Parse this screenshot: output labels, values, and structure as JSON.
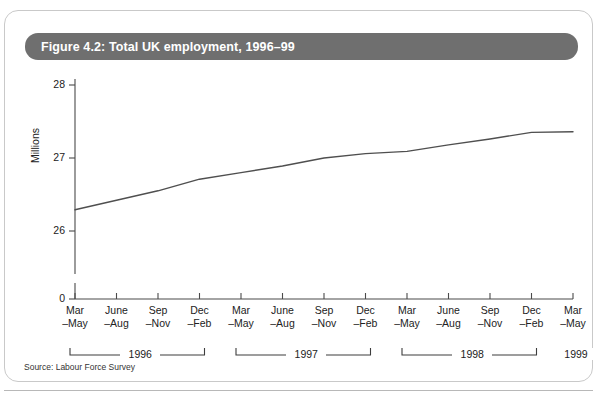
{
  "figure": {
    "title": "Figure 4.2: Total UK employment, 1996–99",
    "source": "Source: Labour Force Survey",
    "banner_color": "#6f6f6f",
    "line_color": "#4f4f4f"
  },
  "chart_data": {
    "type": "line",
    "title": "Figure 4.2: Total UK employment, 1996–99",
    "xlabel": "",
    "ylabel": "Millions",
    "ylim": [
      25.6,
      28.0
    ],
    "yticks": [
      26,
      27,
      28
    ],
    "ytick_labels": [
      "26",
      "27",
      "28"
    ],
    "y_origin_label": "0",
    "y_axis_broken": true,
    "grid": false,
    "legend": null,
    "categories": [
      "Mar\n–May",
      "June\n–Aug",
      "Sep\n–Nov",
      "Dec\n–Feb",
      "Mar\n–May",
      "June\n–Aug",
      "Sep\n–Nov",
      "Dec\n–Feb",
      "Mar\n–May",
      "June\n–Aug",
      "Sep\n–Nov",
      "Dec\n–Feb",
      "Mar\n–May"
    ],
    "tick_labels_line1": [
      "Mar",
      "June",
      "Sep",
      "Dec",
      "Mar",
      "June",
      "Sep",
      "Dec",
      "Mar",
      "June",
      "Sep",
      "Dec",
      "Mar"
    ],
    "tick_labels_line2": [
      "–May",
      "–Aug",
      "–Nov",
      "–Feb",
      "–May",
      "–Aug",
      "–Nov",
      "–Feb",
      "–May",
      "–Aug",
      "–Nov",
      "–Feb",
      "–May"
    ],
    "values": [
      26.29,
      26.42,
      26.55,
      26.71,
      26.8,
      26.89,
      27.0,
      27.06,
      27.09,
      27.18,
      27.26,
      27.35,
      27.36
    ],
    "series": [
      {
        "name": "Total UK employment",
        "values": [
          26.29,
          26.42,
          26.55,
          26.71,
          26.8,
          26.89,
          27.0,
          27.06,
          27.09,
          27.18,
          27.26,
          27.35,
          27.36
        ]
      }
    ],
    "year_brackets": [
      {
        "label": "1996",
        "start_index": 0,
        "end_index": 3
      },
      {
        "label": "1997",
        "start_index": 4,
        "end_index": 7
      },
      {
        "label": "1998",
        "start_index": 8,
        "end_index": 11
      },
      {
        "label": "1999",
        "start_index": 12,
        "end_index": 12
      }
    ],
    "annotations": []
  }
}
